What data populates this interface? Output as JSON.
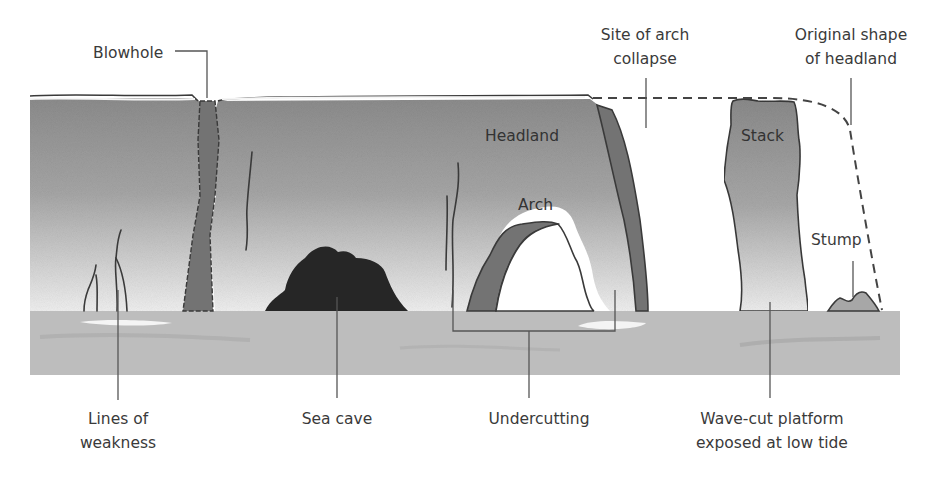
{
  "colors": {
    "background": "#ffffff",
    "rock_top": "#8e8e8e",
    "rock_bottom": "#ececec",
    "rock_dark_band": "#6f6f6f",
    "sea_cave": "#262626",
    "platform": "#bdbdbd",
    "platform_highlight": "#f2f2f2",
    "outline": "#3a3a3a",
    "label_text": "#3a3a3a",
    "dashed_outline": "#444444"
  },
  "top_labels": {
    "blowhole": "Blowhole",
    "arch_collapse_line1": "Site of arch",
    "arch_collapse_line2": "collapse",
    "original_shape_line1": "Original shape",
    "original_shape_line2": "of headland"
  },
  "inline_labels": {
    "headland": "Headland",
    "arch": "Arch",
    "stack": "Stack",
    "stump": "Stump"
  },
  "bottom_labels": {
    "lines_of_weakness_line1": "Lines of",
    "lines_of_weakness_line2": "weakness",
    "sea_cave": "Sea cave",
    "undercutting": "Undercutting",
    "wave_cut_line1": "Wave-cut platform",
    "wave_cut_line2": "exposed at low tide"
  }
}
